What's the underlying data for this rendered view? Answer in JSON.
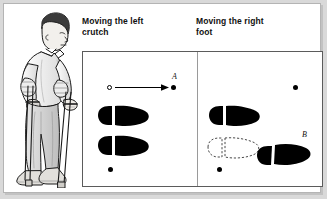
{
  "figure": {
    "illustration": {
      "name": "person-walking-with-forearm-crutches",
      "description": "Man leaning forward using two forearm crutches"
    },
    "panels": [
      {
        "id": "left",
        "title": "Moving the left\ncrutch",
        "title_line1": "Moving the left",
        "title_line2": "crutch",
        "markers": [
          {
            "name": "start-crutch-tip",
            "type": "open-circle",
            "x": 26,
            "y": 35
          },
          {
            "name": "end-crutch-tip",
            "type": "filled-dot",
            "x": 89,
            "y": 35,
            "label": "A"
          },
          {
            "name": "right-crutch-tip",
            "type": "filled-dot",
            "x": 27,
            "y": 117
          }
        ],
        "movement_label": "A",
        "arrow": {
          "name": "left-crutch-movement-arrow",
          "from_x": 33,
          "to_x": 85,
          "y": 37
        },
        "footprints": [
          {
            "name": "left-foot-print",
            "x": 14,
            "y": 55,
            "style": "solid"
          },
          {
            "name": "right-foot-print",
            "x": 14,
            "y": 85,
            "style": "solid"
          }
        ]
      },
      {
        "id": "right",
        "title": "Moving the right\nfoot",
        "title_line1": "Moving the right",
        "title_line2": "foot",
        "markers": [
          {
            "name": "right-crutch-tip",
            "type": "filled-dot",
            "x": 96,
            "y": 35
          },
          {
            "name": "left-crutch-tip",
            "type": "filled-dot",
            "x": 21,
            "y": 117
          }
        ],
        "movement_label": "B",
        "footprints": [
          {
            "name": "left-foot-print",
            "x": 10,
            "y": 55,
            "style": "solid"
          },
          {
            "name": "right-foot-previous-position",
            "x": 8,
            "y": 86,
            "style": "dashed"
          },
          {
            "name": "right-foot-new-position",
            "x": 58,
            "y": 90,
            "style": "solid",
            "label": "B"
          }
        ]
      }
    ]
  },
  "colors": {
    "page_background": "#d9d9d9",
    "sheet_background": "#ffffff",
    "ink": "#000000",
    "box_border": "#5b5b5b",
    "divider": "#9a9a9a",
    "heading_text": "#111111"
  }
}
